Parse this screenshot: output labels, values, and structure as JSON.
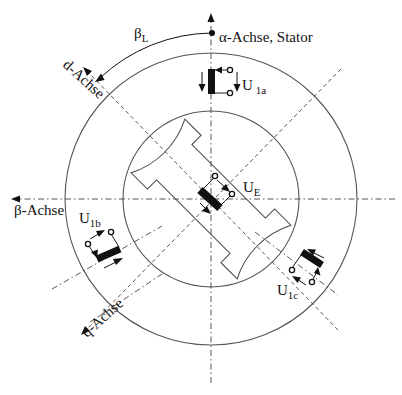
{
  "figure": {
    "type": "diagram",
    "axes": {
      "alpha": "α-Achse, Stator",
      "beta": "β-Achse",
      "d": "d-Achse",
      "q": "q-Achse"
    },
    "angle": {
      "symbol": "β",
      "subscript": "L"
    },
    "voltages": {
      "u1a": {
        "symbol": "U",
        "subscript": "1a"
      },
      "u1b": {
        "symbol": "U",
        "subscript": "1b"
      },
      "u1c": {
        "symbol": "U",
        "subscript": "1c"
      },
      "ue": {
        "symbol": "U",
        "subscript": "E"
      }
    },
    "colors": {
      "line": "#444444",
      "coil": "#111111",
      "background": "#ffffff"
    }
  }
}
